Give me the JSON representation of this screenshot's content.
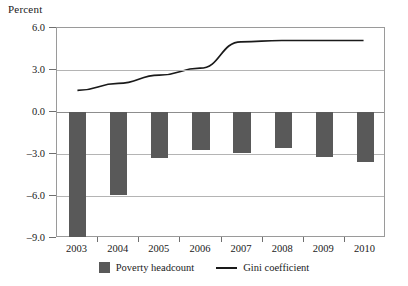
{
  "chart_data": {
    "type": "bar",
    "title": "",
    "subtitle": "",
    "xlabel": "",
    "ylabel": "Percent",
    "categories": [
      "2003",
      "2004",
      "2005",
      "2006",
      "2007",
      "2008",
      "2009",
      "2010"
    ],
    "ylim": [
      -9.0,
      6.0
    ],
    "yticks": [
      6.0,
      3.0,
      0.0,
      -3.0,
      -6.0,
      -9.0
    ],
    "ytick_labels": [
      "6.0",
      "3.0",
      "0.0",
      "-3.0",
      "-6.0",
      "-9.0"
    ],
    "grid": true,
    "legend_position": "bottom",
    "series": [
      {
        "name": "Poverty headcount",
        "type": "bar",
        "color": "#595959",
        "values": [
          -8.9,
          -5.9,
          -3.3,
          -2.7,
          -2.9,
          -2.6,
          -3.2,
          -3.6
        ]
      },
      {
        "name": "Gini coefficient",
        "type": "line",
        "color": "#1a1a1a",
        "values": [
          1.5,
          2.0,
          2.6,
          3.1,
          5.0,
          5.1,
          5.1,
          5.1
        ]
      }
    ]
  },
  "axis": {
    "unit_label": "Percent"
  },
  "legend": {
    "items": [
      {
        "label": "Poverty headcount",
        "marker": "square-swatch-icon",
        "color": "#595959"
      },
      {
        "label": "Gini coefficient",
        "marker": "line-swatch-icon",
        "color": "#1a1a1a"
      }
    ]
  }
}
